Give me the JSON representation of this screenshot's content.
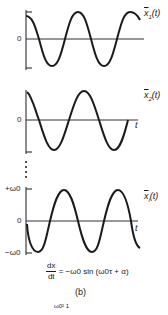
{
  "figure": {
    "caption": "(b)",
    "panels": [
      {
        "id": "x1",
        "label": "ẋ1(t)",
        "label_base": "x",
        "label_sub": "1",
        "zero_label": "0",
        "t_label": ""
      },
      {
        "id": "x2",
        "label": "ẋ2(t)",
        "label_base": "x",
        "label_sub": "2",
        "zero_label": "0",
        "t_label": "t"
      },
      {
        "id": "xi",
        "label": "ẋi(t)",
        "label_base": "x",
        "label_sub": "i",
        "zero_label": "0",
        "t_label": "t",
        "top_label": "+ω0",
        "bottom_label": "−ω0"
      }
    ],
    "equation": {
      "lhs_num": "dx",
      "lhs_den": "dt",
      "rhs": "= −ω0 sin (ω0τ + α)"
    },
    "footer_fragment": "ω0² 1",
    "line_color": "#1a1a1a"
  }
}
